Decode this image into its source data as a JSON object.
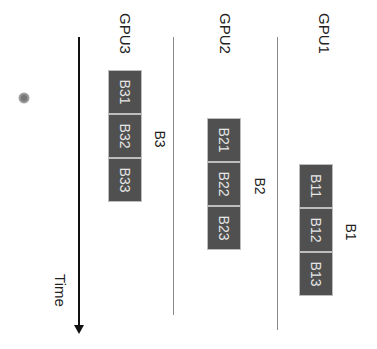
{
  "lanes": [
    {
      "label": "GPU3",
      "group": "B3",
      "blocks": [
        "B31",
        "B32",
        "B33"
      ]
    },
    {
      "label": "GPU2",
      "group": "B2",
      "blocks": [
        "B21",
        "B22",
        "B23"
      ]
    },
    {
      "label": "GPU1",
      "group": "B1",
      "blocks": [
        "B11",
        "B12",
        "B13"
      ]
    }
  ],
  "axis": {
    "label": "Time"
  },
  "colors": {
    "block_fill": "#505050",
    "block_text": "#e6e6e6",
    "lane_line": "#8a8a8a",
    "axis": "#111111"
  }
}
